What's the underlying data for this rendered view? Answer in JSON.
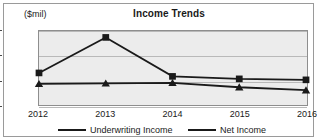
{
  "chart_data": {
    "type": "line",
    "title": "Income Trends",
    "unit_label": "($mil)",
    "xlabel": "",
    "ylabel": "",
    "grid": true,
    "legend_position": "bottom",
    "categories": [
      "2012",
      "2013",
      "2014",
      "2015",
      "2016"
    ],
    "ylim": [
      -5000,
      10000
    ],
    "ytick_values": [
      10000,
      5000,
      0,
      -5000
    ],
    "ytick_labels": [
      "0000",
      "5000",
      "0",
      "5000"
    ],
    "ytick_labels_note": "left-clipped by image edge; true values 10000, 5000, 0, -5000",
    "series": [
      {
        "name": "Underwriting Income",
        "marker": "triangle",
        "color": "#1a1a1a",
        "values": [
          -700,
          -600,
          -500,
          -1400,
          -2000
        ]
      },
      {
        "name": "Net Income",
        "marker": "square",
        "color": "#1a1a1a",
        "values": [
          1500,
          8700,
          800,
          300,
          100
        ]
      }
    ]
  },
  "legend": {
    "items": [
      {
        "label": "Underwriting Income",
        "marker": "triangle"
      },
      {
        "label": "Net Income",
        "marker": "square"
      }
    ]
  },
  "colors": {
    "plot_background": "#ececec",
    "gridline": "#b9b9b9",
    "series_line": "#1a1a1a",
    "frame_border": "#9a9a9a",
    "text": "#1a1a1a"
  }
}
